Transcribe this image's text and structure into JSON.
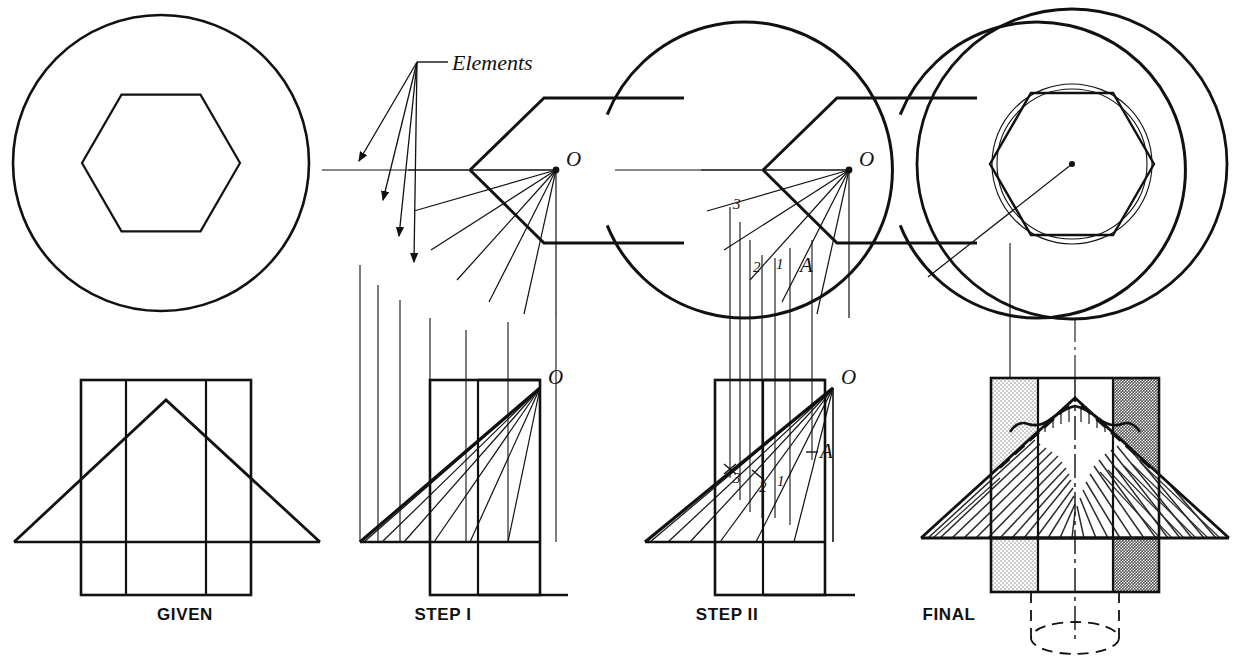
{
  "figure": {
    "background_color": "#ffffff",
    "line_color": "#111111",
    "panel_count": 4
  },
  "panels": [
    {
      "id": "given",
      "caption": "GIVEN",
      "caption_x": 185,
      "caption_y": 620,
      "top_view": {
        "name": "circle-with-hexagon",
        "circle_cx": 161,
        "circle_cy": 163,
        "circle_r": 148,
        "hexagon_cx": 161,
        "hexagon_cy": 163,
        "hexagon_r": 79,
        "hexagon_rotation_deg": 0
      },
      "front_view": {
        "name": "triangle-over-rectangle",
        "rect_left": 81,
        "rect_right": 251,
        "rect_top": 380,
        "rect_bottom": 595,
        "inner_verticals": [
          126,
          206
        ],
        "base_y": 542,
        "apex_x": 166,
        "apex_y": 400,
        "base_left_x": 14,
        "base_right_x": 320
      }
    },
    {
      "id": "step-1",
      "caption": "STEP I",
      "caption_x": 443,
      "caption_y": 620,
      "annotation": "Elements",
      "annotation_x": 452,
      "annotation_y": 68,
      "apex_label": "O",
      "top_view": {
        "name": "partial-circle-with-elements",
        "circle_cx": 470,
        "circle_cy": 170,
        "circle_r": 148,
        "gap_start_deg": -22,
        "gap_end_deg": 22,
        "element_count": 7,
        "center_label": "O"
      },
      "front_view": {
        "name": "element-lines-front",
        "rect_left": 430,
        "rect_right": 540,
        "rect_top": 380,
        "rect_bottom": 595,
        "base_y": 542,
        "apex_x": 540,
        "apex_y": 388,
        "base_left_x": 360,
        "element_count": 5
      }
    },
    {
      "id": "step-2",
      "caption": "STEP II",
      "caption_x": 727,
      "caption_y": 620,
      "apex_label": "O",
      "point_labels": [
        "3",
        "2",
        "1",
        "A"
      ],
      "top_view": {
        "name": "partial-circle-with-points",
        "circle_cx": 763,
        "circle_cy": 170,
        "circle_r": 148,
        "center_label": "O",
        "labels": [
          {
            "text": "3",
            "x": 737,
            "y": 205
          },
          {
            "text": "2",
            "x": 760,
            "y": 268
          },
          {
            "text": "1",
            "x": 781,
            "y": 265
          },
          {
            "text": "A",
            "x": 806,
            "y": 266
          }
        ]
      },
      "front_view": {
        "name": "element-lines-front-labeled",
        "rect_left": 715,
        "rect_right": 825,
        "rect_top": 380,
        "rect_bottom": 595,
        "base_y": 542,
        "apex_x": 833,
        "apex_y": 388,
        "base_left_x": 645,
        "labels": [
          {
            "text": "3",
            "x": 736,
            "y": 477
          },
          {
            "text": "2",
            "x": 764,
            "y": 487
          },
          {
            "text": "1",
            "x": 781,
            "y": 481
          },
          {
            "text": "A",
            "x": 808,
            "y": 458
          }
        ]
      }
    },
    {
      "id": "final",
      "caption": "FINAL",
      "caption_x": 949,
      "caption_y": 620,
      "top_view": {
        "name": "final-circle-hexagon-intersection",
        "circle_cx": 1072,
        "circle_cy": 164,
        "circle_r": 155,
        "hexagon_r": 82,
        "inner_circle_r1": 76,
        "inner_circle_r2": 80,
        "center_dot": true,
        "has_radius_leader": true
      },
      "front_view": {
        "name": "final-shaded-solid",
        "rect_left": 991,
        "rect_right": 1159,
        "rect_top": 378,
        "rect_bottom": 592,
        "base_y": 538,
        "apex_x": 1075,
        "apex_y": 398,
        "base_left_x": 921,
        "base_right_x": 1229,
        "has_hatching": true,
        "has_hidden_dashed_ellipse": true
      }
    }
  ],
  "colors": {
    "ink": "#111111",
    "light_stipple": "#c9c9c9",
    "dark_stipple": "#6e6e6e",
    "hatch": "#2a2a2a",
    "paper": "#ffffff"
  }
}
